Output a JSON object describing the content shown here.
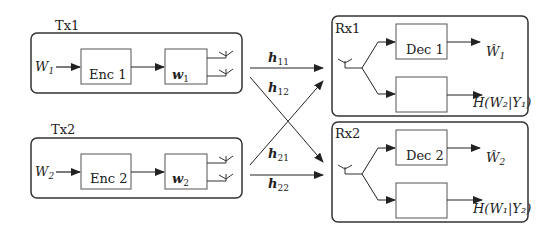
{
  "transmitters": [
    {
      "label": "Tx1",
      "input": "W",
      "input_sub": "1",
      "encoder": "Enc 1",
      "precoder": "w",
      "precoder_sub": "1"
    },
    {
      "label": "Tx2",
      "input": "W",
      "input_sub": "2",
      "encoder": "Enc 2",
      "precoder": "w",
      "precoder_sub": "2"
    }
  ],
  "channels": [
    {
      "label": "h",
      "sub": "11"
    },
    {
      "label": "h",
      "sub": "12"
    },
    {
      "label": "h",
      "sub": "21"
    },
    {
      "label": "h",
      "sub": "22"
    }
  ],
  "receivers": [
    {
      "label": "Rx1",
      "decoder": "Dec 1",
      "output": "Ŵ",
      "output_sub": "1",
      "equivocation": "H(W₂|Y₁)"
    },
    {
      "label": "Rx2",
      "decoder": "Dec 2",
      "output": "Ŵ",
      "output_sub": "2",
      "equivocation": "H(W₁|Y₂)"
    }
  ]
}
